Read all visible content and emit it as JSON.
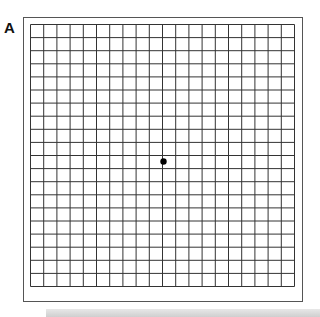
{
  "figure": {
    "panel_label": "A",
    "type": "Amsler grid",
    "grid": {
      "rows": 20,
      "cols": 20,
      "line_color": "#333333"
    },
    "fixation_dot": {
      "color": "#000000",
      "position": "center"
    }
  }
}
